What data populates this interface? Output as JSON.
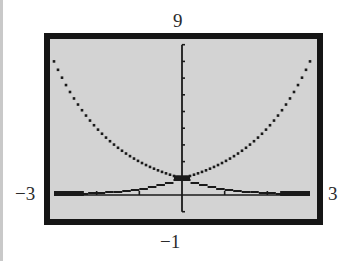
{
  "window": {
    "ymax_label": "9",
    "ymin_label": "−1",
    "xmin_label": "−3",
    "xmax_label": "3"
  },
  "colors": {
    "frame": "#151515",
    "screen": "#d3d3d3",
    "plot": "#1a1a1a",
    "label": "#2b2b2b"
  },
  "chart_data": {
    "type": "line",
    "title": "",
    "xlabel": "",
    "ylabel": "",
    "xlim": [
      -3,
      3
    ],
    "ylim": [
      -1,
      9
    ],
    "xscale": 1,
    "yscale": 1,
    "grid": false,
    "legend": null,
    "axis_labels": {
      "xmin": "−3",
      "xmax": "3",
      "ymin": "−1",
      "ymax": "9"
    },
    "series": [
      {
        "name": "upper curve (e^|x|)",
        "style": "dotted pixel line",
        "x": [
          -3,
          -2.5,
          -2,
          -1.5,
          -1,
          -0.5,
          0,
          0.5,
          1,
          1.5,
          2,
          2.5,
          3
        ],
        "values": [
          8.0,
          6.5,
          5.0,
          3.6,
          2.6,
          1.6,
          1.0,
          1.6,
          2.6,
          3.6,
          5.0,
          6.5,
          8.0
        ]
      },
      {
        "name": "lower curve (e^-|x|)",
        "style": "stepped pixel line",
        "x": [
          -3,
          -2.5,
          -2,
          -1.5,
          -1,
          -0.5,
          0,
          0.5,
          1,
          1.5,
          2,
          2.5,
          3
        ],
        "values": [
          0.05,
          0.08,
          0.14,
          0.22,
          0.37,
          0.61,
          1.0,
          0.61,
          0.37,
          0.22,
          0.14,
          0.08,
          0.05
        ]
      }
    ]
  }
}
